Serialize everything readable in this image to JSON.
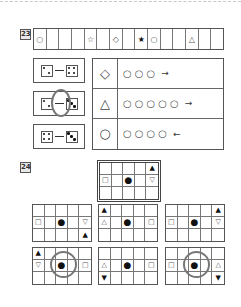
{
  "q23": {
    "number": "23",
    "strip": [
      "○",
      "",
      "",
      "",
      "☆",
      "",
      "◇",
      "",
      "★",
      "○",
      "",
      "",
      "△",
      "",
      ""
    ],
    "dice_options": [
      {
        "left": 2,
        "right": 4,
        "selected": false
      },
      {
        "left": 2,
        "right": 3,
        "selected": true
      },
      {
        "left": 4,
        "right": 3,
        "selected": false
      }
    ],
    "rules": [
      {
        "key": "◇",
        "circles": [
          "○",
          "○",
          "○"
        ],
        "arrow": "→"
      },
      {
        "key": "△",
        "circles": [
          "○",
          "○",
          "○",
          "○",
          "○"
        ],
        "arrow": "→"
      },
      {
        "key": "○",
        "circles": [
          "○",
          "○",
          "○",
          "○"
        ],
        "arrow": "←"
      }
    ]
  },
  "q24": {
    "number": "24",
    "reference": [
      [
        "",
        "",
        "",
        "",
        "▲"
      ],
      [
        "□",
        "",
        "●",
        "",
        "▽"
      ],
      [
        "",
        "",
        "",
        "",
        ""
      ]
    ],
    "options": [
      {
        "selected": false,
        "cells": [
          [
            "",
            "",
            "",
            "",
            ""
          ],
          [
            "□",
            "",
            "●",
            "",
            "▽"
          ],
          [
            "",
            "",
            "",
            "",
            "▲"
          ]
        ]
      },
      {
        "selected": false,
        "cells": [
          [
            "▲",
            "",
            "",
            "",
            ""
          ],
          [
            "△",
            "",
            "●",
            "",
            "□"
          ],
          [
            "",
            "",
            "",
            "",
            ""
          ]
        ]
      },
      {
        "selected": false,
        "cells": [
          [
            "",
            "",
            "",
            "",
            "▲"
          ],
          [
            "□",
            "",
            "●",
            "",
            "▽"
          ],
          [
            "",
            "",
            "",
            "",
            ""
          ]
        ]
      },
      {
        "selected": true,
        "cells": [
          [
            "▲",
            "",
            "",
            "",
            ""
          ],
          [
            "▽",
            "",
            "●",
            "",
            "□"
          ],
          [
            "",
            "",
            "",
            "",
            ""
          ]
        ]
      },
      {
        "selected": false,
        "cells": [
          [
            "",
            "",
            "",
            "",
            ""
          ],
          [
            "△",
            "",
            "●",
            "",
            "□"
          ],
          [
            "▼",
            "",
            "",
            "",
            ""
          ]
        ]
      },
      {
        "selected": true,
        "cells": [
          [
            "",
            "",
            "",
            "",
            ""
          ],
          [
            "□",
            "",
            "●",
            "",
            "△"
          ],
          [
            "",
            "",
            "",
            "",
            "▼"
          ]
        ]
      }
    ]
  }
}
